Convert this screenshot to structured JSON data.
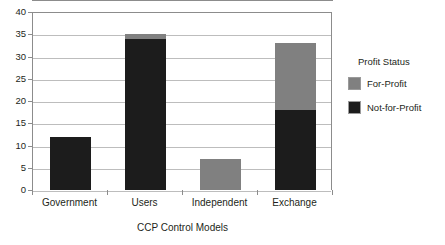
{
  "chart_data": {
    "type": "bar",
    "subtype": "stacked-vertical-bar",
    "title": "",
    "xlabel": "CCP Control Models",
    "ylabel": "",
    "categories": [
      "Government",
      "Users",
      "Independent",
      "Exchange"
    ],
    "series": [
      {
        "name": "Not-for-Profit",
        "color": "#1c1c1c",
        "values": [
          12,
          34,
          0,
          18
        ]
      },
      {
        "name": "For-Profit",
        "color": "#808080",
        "values": [
          0,
          1,
          7,
          15
        ]
      }
    ],
    "stack_order_bottom_to_top": [
      "Not-for-Profit",
      "For-Profit"
    ],
    "totals": [
      12,
      35,
      7,
      33
    ],
    "ylim": [
      0,
      40
    ],
    "ytick_step": 5,
    "yticks": [
      "0",
      "5",
      "10",
      "15",
      "20",
      "25",
      "30",
      "35",
      "40"
    ],
    "grid": "horizontal",
    "legend_position": "right",
    "legend": {
      "title": "Profit Status",
      "entries": [
        {
          "label": "For-Profit",
          "color": "#808080"
        },
        {
          "label": "Not-for-Profit",
          "color": "#1c1c1c"
        }
      ]
    },
    "colors": {
      "for_profit": "#808080",
      "not_for_profit": "#1c1c1c",
      "gridline": "#bdbdbd",
      "axis": "#8c8c8c",
      "text": "#231f20",
      "background": "#ffffff"
    }
  },
  "caption_strip": ""
}
